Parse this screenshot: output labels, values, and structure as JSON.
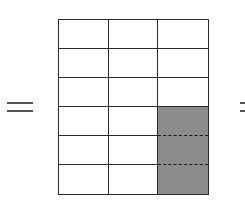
{
  "diagram": {
    "type": "fraction-area-model",
    "rows": 6,
    "columns": 3,
    "total_cells": 18,
    "shaded_cells": 3,
    "shaded_positions": [
      [
        3,
        2
      ],
      [
        4,
        2
      ],
      [
        5,
        2
      ]
    ],
    "shaded_description": "bottom three cells of the rightmost column",
    "left_symbol": "=",
    "right_symbol": "=",
    "colors": {
      "grid_line": "#2a2a2a",
      "cell_fill": "#ffffff",
      "shaded_fill": "#8c8c8c",
      "symbol": "#555555"
    }
  }
}
